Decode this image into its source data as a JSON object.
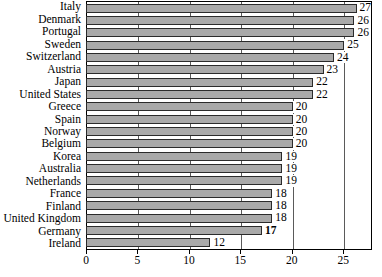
{
  "chart_data": {
    "type": "bar",
    "orientation": "horizontal",
    "title": "",
    "xlabel": "",
    "ylabel": "",
    "xlim": [
      0,
      27.8
    ],
    "xticks": [
      0,
      5,
      10,
      15,
      20,
      25
    ],
    "grid": true,
    "legend": null,
    "bar_color": "#a9a9a9",
    "bar_edge_color": "#2b2b2b",
    "highlight": {
      "category": "Germany",
      "value": 17,
      "style": "bold"
    },
    "categories": [
      "Italy",
      "Denmark",
      "Portugal",
      "Sweden",
      "Switzerland",
      "Austria",
      "Japan",
      "United States",
      "Greece",
      "Spain",
      "Norway",
      "Belgium",
      "Korea",
      "Australia",
      "Netherlands",
      "France",
      "Finland",
      "United Kingdom",
      "Germany",
      "Ireland"
    ],
    "values": [
      27,
      26,
      26,
      25,
      24,
      23,
      22,
      22,
      20,
      20,
      20,
      20,
      19,
      19,
      19,
      18,
      18,
      18,
      17,
      12
    ],
    "data_labels": [
      "27",
      "26",
      "26",
      "25",
      "24",
      "23",
      "22",
      "22",
      "20",
      "20",
      "20",
      "20",
      "19",
      "19",
      "19",
      "18",
      "18",
      "18",
      "17",
      "12"
    ],
    "bold_labels": [
      false,
      false,
      false,
      false,
      false,
      false,
      false,
      false,
      false,
      false,
      false,
      false,
      false,
      false,
      false,
      false,
      false,
      false,
      true,
      false
    ],
    "xtick_labels": [
      "0",
      "5",
      "10",
      "15",
      "20",
      "25"
    ]
  }
}
